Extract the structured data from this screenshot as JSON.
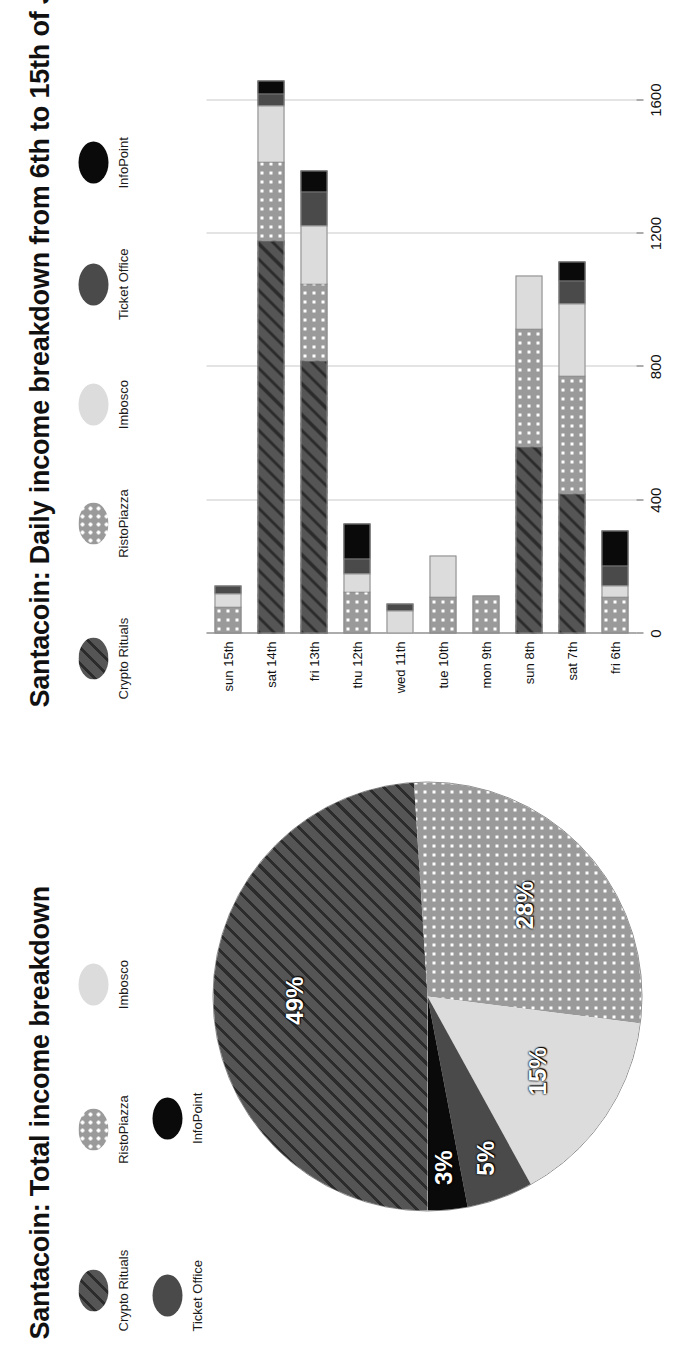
{
  "figure": {
    "pie_panel_title": "Santacoin: Total income breakdown",
    "bar_panel_title": "Santacoin: Daily income breakdown from 6th to 15th of July 2018"
  },
  "series_meta": [
    {
      "key": "crypto",
      "label": "Crypto Rituals",
      "pattern": "diagonal-hatch",
      "color": "#555555"
    },
    {
      "key": "risto",
      "label": "RistoPiazza",
      "pattern": "white-dots",
      "color": "#9a9a9a"
    },
    {
      "key": "imbosco",
      "label": "Imbosco",
      "pattern": "solid-light",
      "color": "#dcdcdc"
    },
    {
      "key": "ticket",
      "label": "Ticket Office",
      "pattern": "solid-dark",
      "color": "#4a4a4a"
    },
    {
      "key": "info",
      "label": "InfoPoint",
      "pattern": "solid-black",
      "color": "#0a0a0a"
    }
  ],
  "pie_legend_row1": [
    "Crypto Rituals",
    "RistoPiazza",
    "Imbosco"
  ],
  "pie_legend_row2": [
    "Ticket Office",
    "InfoPoint"
  ],
  "bar_legend": [
    "Crypto Rituals",
    "RistoPiazza",
    "Imbosco",
    "Ticket Office",
    "InfoPoint"
  ],
  "chart_data": [
    {
      "type": "pie",
      "title": "Santacoin: Total income breakdown",
      "legend_position": "top",
      "labels": [
        "Crypto Rituals",
        "RistoPiazza",
        "Imbosco",
        "Ticket Office",
        "InfoPoint"
      ],
      "values": [
        49,
        28,
        15,
        5,
        3
      ],
      "data_labels": [
        "49%",
        "28%",
        "15%",
        "5%",
        "3%"
      ],
      "unit": "percent"
    },
    {
      "type": "bar",
      "subtype": "stacked-horizontal-bar",
      "title": "Santacoin: Daily income breakdown from 6th to 15th of July 2018",
      "xlabel": "",
      "ylabel": "",
      "grid": true,
      "legend_position": "top",
      "axis_range": [
        0,
        1800
      ],
      "tick_labels": [
        "0",
        "400",
        "800",
        "1200",
        "1600"
      ],
      "tick_values": [
        0,
        400,
        800,
        1200,
        1600
      ],
      "categories": [
        "fri 6th",
        "sat 7th",
        "sun 8th",
        "mon 9th",
        "tue 10th",
        "wed 11th",
        "thu 12th",
        "fri 13th",
        "sat 14th",
        "sun 15th"
      ],
      "series": [
        {
          "name": "Crypto Rituals",
          "values": [
            0,
            420,
            560,
            0,
            0,
            0,
            0,
            820,
            1180,
            0
          ]
        },
        {
          "name": "RistoPiazza",
          "values": [
            110,
            355,
            355,
            115,
            110,
            0,
            125,
            230,
            235,
            80
          ]
        },
        {
          "name": "Imbosco",
          "values": [
            35,
            215,
            160,
            0,
            125,
            70,
            55,
            175,
            170,
            40
          ]
        },
        {
          "name": "Ticket Office",
          "values": [
            60,
            70,
            0,
            0,
            0,
            20,
            45,
            100,
            35,
            25
          ]
        },
        {
          "name": "InfoPoint",
          "values": [
            105,
            55,
            0,
            0,
            0,
            0,
            105,
            65,
            40,
            0
          ]
        }
      ],
      "totals": [
        310,
        1115,
        1075,
        115,
        235,
        90,
        330,
        1390,
        1660,
        145
      ]
    }
  ]
}
